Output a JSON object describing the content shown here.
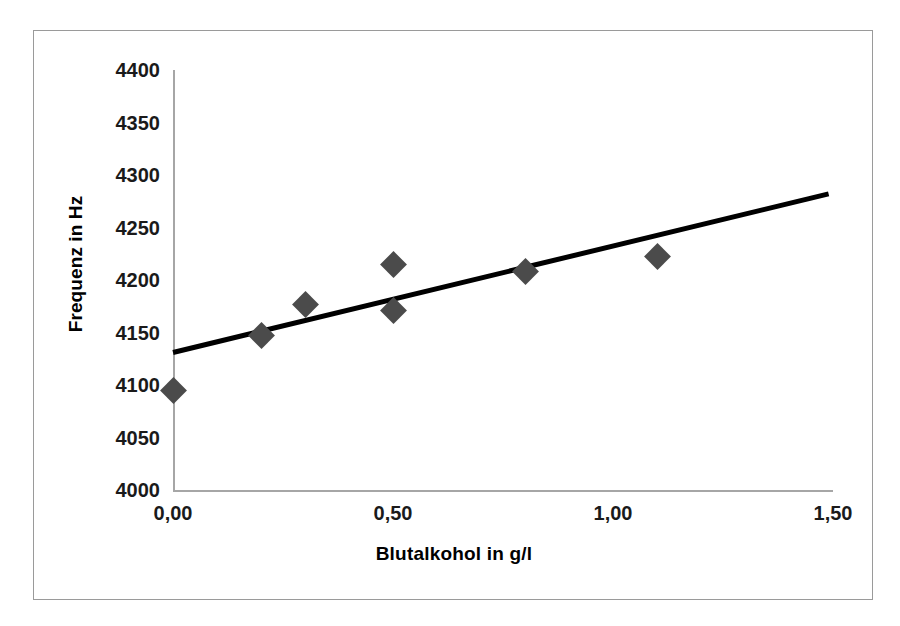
{
  "chart_data": {
    "type": "scatter",
    "title": "",
    "xlabel": "Blutalkohol in g/l",
    "ylabel": "Frequenz in Hz",
    "xlim": [
      0.0,
      1.5
    ],
    "ylim": [
      4000,
      4400
    ],
    "xticks": [
      0.0,
      0.5,
      1.0,
      1.5
    ],
    "xtick_labels": [
      "0,00",
      "0,50",
      "1,00",
      "1,50"
    ],
    "yticks": [
      4000,
      4050,
      4100,
      4150,
      4200,
      4250,
      4300,
      4350,
      4400
    ],
    "ytick_labels": [
      "4000",
      "4050",
      "4100",
      "4150",
      "4200",
      "4250",
      "4300",
      "4350",
      "4400"
    ],
    "grid": false,
    "legend": null,
    "series": [
      {
        "name": "Messwerte",
        "type": "scatter",
        "marker": "diamond",
        "color": "#4b4b4b",
        "points": [
          {
            "x": 0.0,
            "y": 4095
          },
          {
            "x": 0.2,
            "y": 4147
          },
          {
            "x": 0.3,
            "y": 4177
          },
          {
            "x": 0.5,
            "y": 4215
          },
          {
            "x": 0.5,
            "y": 4171
          },
          {
            "x": 0.8,
            "y": 4208
          },
          {
            "x": 1.1,
            "y": 4222
          }
        ]
      },
      {
        "name": "Trendlinie",
        "type": "line",
        "color": "#000000",
        "line_width": 5,
        "points": [
          {
            "x": 0.0,
            "y": 4131
          },
          {
            "x": 1.49,
            "y": 4282
          }
        ]
      }
    ]
  },
  "frame": {
    "border_color": "#9a9a9a",
    "axis_color": "#a6a6a6",
    "background": "#ffffff"
  }
}
